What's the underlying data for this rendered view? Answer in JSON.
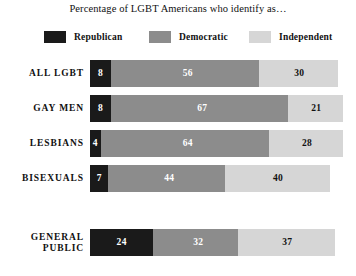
{
  "chart_data": {
    "type": "bar",
    "subtype": "stacked-horizontal",
    "title": "Percentage of LGBT Americans who identify as…",
    "xlabel": "",
    "ylabel": "",
    "xlim": [
      0,
      100
    ],
    "grid": false,
    "legend_position": "top",
    "colors": {
      "republican": "#1a1a1a",
      "democratic": "#8c8c8c",
      "independent": "#d6d6d6",
      "background": "#ffffff",
      "text": "#111111"
    },
    "categories": [
      "ALL LGBT",
      "GAY MEN",
      "LESBIANS",
      "BISEXUALS",
      "GENERAL PUBLIC"
    ],
    "series": [
      {
        "name": "Republican",
        "values": [
          8,
          8,
          4,
          7,
          24
        ]
      },
      {
        "name": "Democratic",
        "values": [
          56,
          67,
          64,
          44,
          32
        ]
      },
      {
        "name": "Independent",
        "values": [
          30,
          21,
          28,
          40,
          37
        ]
      }
    ]
  },
  "title": {
    "text": "Percentage of LGBT Americans who identify as…"
  },
  "legend": {
    "items": [
      {
        "label": "Republican",
        "color": "#1a1a1a",
        "swatch": "legend-swatch-republican"
      },
      {
        "label": "Democratic",
        "color": "#8c8c8c",
        "swatch": "legend-swatch-democratic"
      },
      {
        "label": "Independent",
        "color": "#d6d6d6",
        "swatch": "legend-swatch-independent"
      }
    ]
  },
  "groups": [
    {
      "id": "lgbt",
      "rows": [
        {
          "label": "ALL LGBT",
          "label_name": "row-label-all-lgbt",
          "segments": [
            {
              "series": "Republican",
              "value": "8",
              "color": "#1a1a1a"
            },
            {
              "series": "Democratic",
              "value": "56",
              "color": "#8c8c8c"
            },
            {
              "series": "Independent",
              "value": "30",
              "color": "#d6d6d6"
            }
          ]
        },
        {
          "label": "GAY MEN",
          "label_name": "row-label-gay-men",
          "segments": [
            {
              "series": "Republican",
              "value": "8",
              "color": "#1a1a1a"
            },
            {
              "series": "Democratic",
              "value": "67",
              "color": "#8c8c8c"
            },
            {
              "series": "Independent",
              "value": "21",
              "color": "#d6d6d6"
            }
          ]
        },
        {
          "label": "LESBIANS",
          "label_name": "row-label-lesbians",
          "segments": [
            {
              "series": "Republican",
              "value": "4",
              "color": "#1a1a1a"
            },
            {
              "series": "Democratic",
              "value": "64",
              "color": "#8c8c8c"
            },
            {
              "series": "Independent",
              "value": "28",
              "color": "#d6d6d6"
            }
          ]
        },
        {
          "label": "BISEXUALS",
          "label_name": "row-label-bisexuals",
          "segments": [
            {
              "series": "Republican",
              "value": "7",
              "color": "#1a1a1a"
            },
            {
              "series": "Democratic",
              "value": "44",
              "color": "#8c8c8c"
            },
            {
              "series": "Independent",
              "value": "40",
              "color": "#d6d6d6"
            }
          ]
        }
      ]
    },
    {
      "id": "public",
      "rows": [
        {
          "label": "GENERAL\nPUBLIC",
          "label_name": "row-label-general-public",
          "segments": [
            {
              "series": "Republican",
              "value": "24",
              "color": "#1a1a1a"
            },
            {
              "series": "Democratic",
              "value": "32",
              "color": "#8c8c8c"
            },
            {
              "series": "Independent",
              "value": "37",
              "color": "#d6d6d6"
            }
          ]
        }
      ]
    }
  ]
}
